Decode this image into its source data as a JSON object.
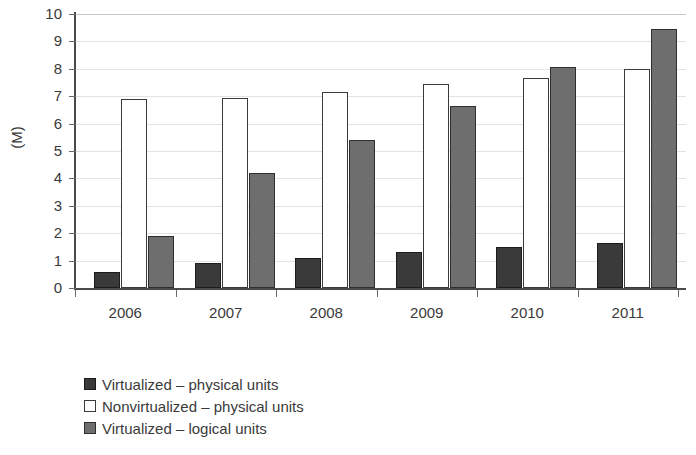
{
  "chart_data": {
    "type": "bar",
    "title": "",
    "xlabel": "",
    "ylabel": "(M)",
    "ylim": [
      0,
      10
    ],
    "ytick_labels": [
      "10",
      "9",
      "8",
      "7",
      "6",
      "5",
      "4",
      "3",
      "2",
      "1",
      "0"
    ],
    "grid": true,
    "legend_position": "bottom-left",
    "categories": [
      "2006",
      "2007",
      "2008",
      "2009",
      "2010",
      "2011"
    ],
    "series": [
      {
        "name": "Virtualized – physical units",
        "swatch": "series-dark",
        "color": "#3a3a3a",
        "values": [
          0.6,
          0.9,
          1.1,
          1.3,
          1.5,
          1.65
        ]
      },
      {
        "name": "Nonvirtualized – physical units",
        "swatch": "series-white",
        "color": "#ffffff",
        "values": [
          6.9,
          6.95,
          7.15,
          7.45,
          7.65,
          8.0
        ]
      },
      {
        "name": "Virtualized – logical units",
        "swatch": "series-gray",
        "color": "#6e6e6e",
        "values": [
          1.9,
          4.2,
          5.4,
          6.65,
          8.05,
          9.45
        ]
      }
    ]
  }
}
